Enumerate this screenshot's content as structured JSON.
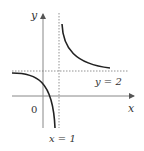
{
  "diagram": {
    "type": "function-graph",
    "function_description": "hyperbola with vertical asymptote x = 1 and horizontal asymptote y = 2",
    "labels": {
      "x_axis": "x",
      "y_axis": "y",
      "origin": "0",
      "vertical_asymptote": "x = 1",
      "horizontal_asymptote": "y = 2"
    },
    "colors": {
      "curve": "#222222",
      "axes": "#888888",
      "asymptotes": "#777777",
      "text": "#333333"
    }
  }
}
